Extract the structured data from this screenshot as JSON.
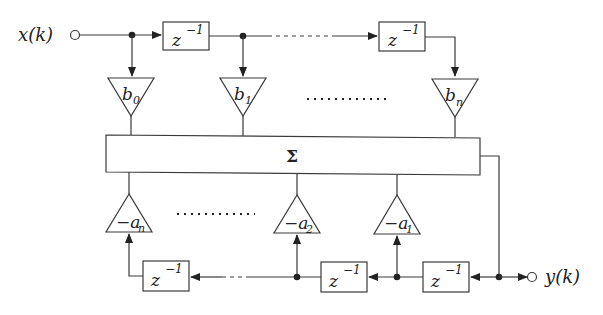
{
  "diagram": {
    "type": "IIR filter direct form block diagram",
    "input": {
      "label": "x(k)"
    },
    "output": {
      "label": "y(k)"
    },
    "summer": {
      "label": "Σ"
    },
    "delay_label": "z",
    "delay_exp": "−1",
    "forward_gains": [
      {
        "sym": "b",
        "sub": "0"
      },
      {
        "sym": "b",
        "sub": "1"
      },
      {
        "sym": "b",
        "sub": "n"
      }
    ],
    "feedback_gains": [
      {
        "sym": "−a",
        "sub": "n"
      },
      {
        "sym": "−a",
        "sub": "2"
      },
      {
        "sym": "−a",
        "sub": "1"
      }
    ],
    "ellipsis": "............"
  }
}
